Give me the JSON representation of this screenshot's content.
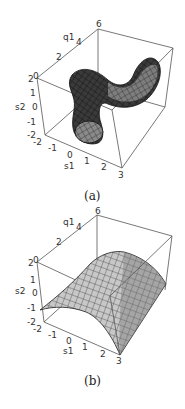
{
  "figure": {
    "panels": [
      {
        "caption": "(a)",
        "axes": {
          "q1": {
            "label": "q1",
            "ticks": [
              "0",
              "2",
              "4",
              "6"
            ]
          },
          "s2": {
            "label": "s2",
            "ticks": [
              "2",
              "1",
              "0",
              "-1",
              "-2"
            ]
          },
          "s1": {
            "label": "s1",
            "ticks": [
              "-2",
              "-1",
              "0",
              "1",
              "2",
              "3"
            ]
          }
        },
        "surface": "twisted tube (dark meshed surface)"
      },
      {
        "caption": "(b)",
        "axes": {
          "q1": {
            "label": "q1",
            "ticks": [
              "0",
              "2",
              "4",
              "6"
            ]
          },
          "s2": {
            "label": "s2",
            "ticks": [
              "2",
              "1",
              "0",
              "-1",
              "-2"
            ]
          },
          "s1": {
            "label": "s1",
            "ticks": [
              "-2",
              "-1",
              "0",
              "1",
              "2",
              "3"
            ]
          }
        },
        "surface": "parabolic cylinder arch (light meshed surface)"
      }
    ]
  }
}
